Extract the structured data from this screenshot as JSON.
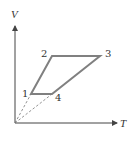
{
  "diagram": {
    "axes": {
      "x_label": "T",
      "y_label": "V"
    },
    "points": [
      {
        "id": "1",
        "label": "1"
      },
      {
        "id": "2",
        "label": "2"
      },
      {
        "id": "3",
        "label": "3"
      },
      {
        "id": "4",
        "label": "4"
      }
    ],
    "path_order": [
      "1",
      "2",
      "3",
      "4",
      "1"
    ],
    "dashed_lines_from_origin": [
      "1",
      "4"
    ],
    "colors": {
      "cycle_stroke": "#808080",
      "axis_stroke": "#444444",
      "dashed_stroke": "#777777"
    }
  }
}
